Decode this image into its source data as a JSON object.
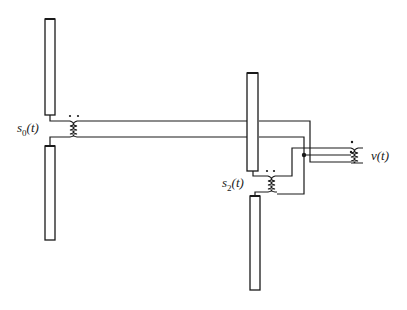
{
  "diagram": {
    "type": "antenna-feed-network",
    "labels": {
      "source_0": {
        "base": "s",
        "sub": "0",
        "arg": "(t)"
      },
      "source_2": {
        "base": "s",
        "sub": "2",
        "arg": "(t)"
      },
      "output": {
        "text": "v(t)"
      }
    },
    "components": [
      {
        "id": "left-dipole-upper-arm",
        "kind": "antenna-element"
      },
      {
        "id": "left-dipole-lower-arm",
        "kind": "antenna-element"
      },
      {
        "id": "right-dipole-upper-arm",
        "kind": "antenna-element"
      },
      {
        "id": "right-dipole-lower-arm",
        "kind": "antenna-element"
      },
      {
        "id": "transformer-s0",
        "kind": "transformer",
        "dots": 2
      },
      {
        "id": "transformer-s2",
        "kind": "transformer",
        "dots": 2
      },
      {
        "id": "transformer-output",
        "kind": "transformer",
        "dots": 2
      },
      {
        "id": "junction",
        "kind": "node"
      }
    ],
    "colors": {
      "stroke": "#1a1a1a",
      "background": "#ffffff"
    }
  }
}
